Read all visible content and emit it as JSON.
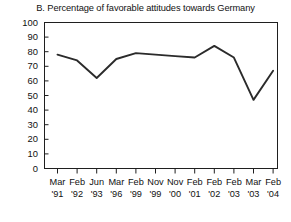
{
  "chart_data": {
    "type": "line",
    "title": "B. Percentage of favorable attitudes towards Germany",
    "xlabel": "",
    "ylabel": "",
    "ylim": [
      0,
      100
    ],
    "ytick_values": [
      100,
      90,
      80,
      70,
      60,
      50,
      40,
      30,
      20,
      10,
      0
    ],
    "ytick_labels": [
      "100",
      "90",
      "80",
      "70",
      "60",
      "50",
      "40",
      "30",
      "20",
      "10",
      "0"
    ],
    "grid": false,
    "legend": "none",
    "line_color": "#2b2b2b",
    "categories": [
      "Mar '91",
      "Feb '92",
      "Jun '93",
      "Mar '96",
      "Feb '99",
      "Nov '99",
      "Nov '00",
      "Feb '01",
      "Feb '02",
      "Feb '03",
      "Mar '03",
      "Feb '04"
    ],
    "xtick_months": [
      "Mar",
      "Feb",
      "Jun",
      "Mar",
      "Feb",
      "Nov",
      "Nov",
      "Feb",
      "Feb",
      "Feb",
      "Mar",
      "Feb"
    ],
    "xtick_years": [
      "'91",
      "'92",
      "'93",
      "'96",
      "'99",
      "'99",
      "'00",
      "'01",
      "'02",
      "'03",
      "'03",
      "'04"
    ],
    "values": [
      78,
      74,
      62,
      75,
      79,
      78,
      77,
      76,
      84,
      76,
      47,
      67
    ],
    "series": [
      {
        "name": "Favorable attitudes towards Germany",
        "values": [
          78,
          74,
          62,
          75,
          79,
          78,
          77,
          76,
          84,
          76,
          47,
          67
        ]
      }
    ]
  }
}
